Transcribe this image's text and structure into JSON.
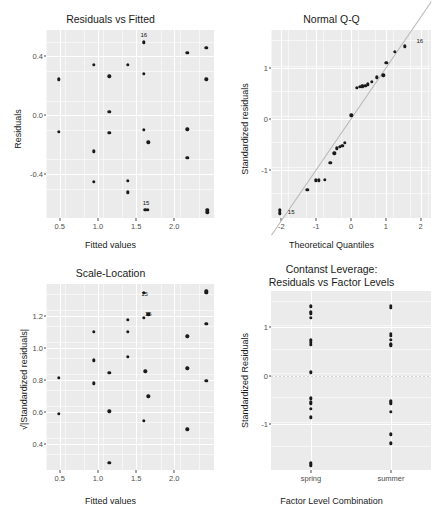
{
  "figure": {
    "kind": "regression-diagnostic-plots",
    "panel_bg": "#ebebeb",
    "grid_color": "#ffffff",
    "point_color": "#1a1a1a",
    "reference_line_color": "#b5b5b5"
  },
  "chart_data": [
    {
      "type": "scatter",
      "title": "Residuals vs Fitted",
      "xlabel": "Fitted values",
      "ylabel": "Residuals",
      "xlim": [
        0.32,
        2.52
      ],
      "ylim": [
        -0.7,
        0.58
      ],
      "xticks": [
        "0.5",
        "1.0",
        "1.5",
        "2.0"
      ],
      "xtickvals": [
        0.5,
        1.0,
        1.5,
        2.0
      ],
      "yticks": [
        "0.4",
        "0.0",
        "-0.4"
      ],
      "ytickvals": [
        0.4,
        0.0,
        -0.4
      ],
      "grid": true,
      "points": [
        {
          "x": 0.49,
          "y": 0.245
        },
        {
          "x": 0.49,
          "y": -0.115
        },
        {
          "x": 0.95,
          "y": 0.345
        },
        {
          "x": 0.95,
          "y": -0.245
        },
        {
          "x": 0.95,
          "y": -0.455
        },
        {
          "x": 1.15,
          "y": 0.265
        },
        {
          "x": 1.15,
          "y": 0.025
        },
        {
          "x": 1.15,
          "y": -0.12
        },
        {
          "x": 1.39,
          "y": 0.345
        },
        {
          "x": 1.39,
          "y": -0.445
        },
        {
          "x": 1.39,
          "y": -0.525
        },
        {
          "x": 1.6,
          "y": 0.495
        },
        {
          "x": 1.6,
          "y": 0.28
        },
        {
          "x": 1.6,
          "y": -0.1
        },
        {
          "x": 1.66,
          "y": -0.185
        },
        {
          "x": 1.62,
          "y": -0.645
        },
        {
          "x": 1.65,
          "y": -0.645
        },
        {
          "x": 2.17,
          "y": 0.425
        },
        {
          "x": 2.17,
          "y": -0.095
        },
        {
          "x": 2.17,
          "y": -0.29
        },
        {
          "x": 2.42,
          "y": 0.46
        },
        {
          "x": 2.42,
          "y": 0.245
        },
        {
          "x": 2.43,
          "y": -0.645
        },
        {
          "x": 2.43,
          "y": -0.66
        }
      ],
      "labels": [
        {
          "x": 1.6,
          "y": 0.545,
          "text": "16"
        },
        {
          "x": 1.63,
          "y": -0.6,
          "text": "15"
        }
      ]
    },
    {
      "type": "scatter",
      "title": "Normal Q-Q",
      "xlabel": "Theoretical Quantiles",
      "ylabel": "Standardized residuals",
      "xlim": [
        -2.3,
        2.3
      ],
      "ylim": [
        -1.95,
        1.75
      ],
      "xticks": [
        "-2",
        "-1",
        "0",
        "1",
        "2"
      ],
      "xtickvals": [
        -2,
        -1,
        0,
        1,
        2
      ],
      "yticks": [
        "1",
        "0",
        "-1"
      ],
      "ytickvals": [
        1,
        0,
        -1
      ],
      "grid": true,
      "reference_line": {
        "slope": 1.0,
        "intercept": 0.02
      },
      "points": [
        {
          "x": -2.05,
          "y": -1.8
        },
        {
          "x": -2.05,
          "y": -1.86
        },
        {
          "x": -1.26,
          "y": -1.4
        },
        {
          "x": -1.02,
          "y": -1.21
        },
        {
          "x": -0.93,
          "y": -1.21
        },
        {
          "x": -0.75,
          "y": -1.2
        },
        {
          "x": -0.6,
          "y": -0.86
        },
        {
          "x": -0.48,
          "y": -0.68
        },
        {
          "x": -0.41,
          "y": -0.58
        },
        {
          "x": -0.33,
          "y": -0.55
        },
        {
          "x": -0.25,
          "y": -0.53
        },
        {
          "x": -0.17,
          "y": -0.47
        },
        {
          "x": 0.01,
          "y": 0.07
        },
        {
          "x": 0.17,
          "y": 0.61
        },
        {
          "x": 0.25,
          "y": 0.63
        },
        {
          "x": 0.33,
          "y": 0.64
        },
        {
          "x": 0.41,
          "y": 0.65
        },
        {
          "x": 0.49,
          "y": 0.68
        },
        {
          "x": 0.6,
          "y": 0.73
        },
        {
          "x": 0.75,
          "y": 0.82
        },
        {
          "x": 0.93,
          "y": 0.86
        },
        {
          "x": 1.02,
          "y": 1.1
        },
        {
          "x": 1.26,
          "y": 1.32
        },
        {
          "x": 1.55,
          "y": 1.43
        }
      ],
      "labels": [
        {
          "x": 1.98,
          "y": 1.53,
          "text": "16"
        },
        {
          "x": -1.72,
          "y": -1.83,
          "text": "15"
        }
      ]
    },
    {
      "type": "scatter",
      "title": "Scale-Location",
      "xlabel": "Fitted values",
      "ylabel": "√|Standardized residuals|",
      "xlim": [
        0.32,
        2.52
      ],
      "ylim": [
        0.24,
        1.4
      ],
      "xticks": [
        "0.5",
        "1.0",
        "1.5",
        "2.0"
      ],
      "xtickvals": [
        0.5,
        1.0,
        1.5,
        2.0
      ],
      "yticks": [
        "1.2",
        "1.0",
        "0.8",
        "0.6",
        "0.4"
      ],
      "ytickvals": [
        1.2,
        1.0,
        0.8,
        0.6,
        0.4
      ],
      "grid": true,
      "points": [
        {
          "x": 0.49,
          "y": 0.815
        },
        {
          "x": 0.49,
          "y": 0.59
        },
        {
          "x": 0.95,
          "y": 1.1
        },
        {
          "x": 0.95,
          "y": 0.925
        },
        {
          "x": 0.95,
          "y": 0.78
        },
        {
          "x": 1.15,
          "y": 0.845
        },
        {
          "x": 1.15,
          "y": 0.605
        },
        {
          "x": 1.15,
          "y": 0.285
        },
        {
          "x": 1.39,
          "y": 1.175
        },
        {
          "x": 1.39,
          "y": 1.1
        },
        {
          "x": 1.39,
          "y": 0.945
        },
        {
          "x": 1.6,
          "y": 1.345
        },
        {
          "x": 1.6,
          "y": 1.19
        },
        {
          "x": 1.66,
          "y": 1.21
        },
        {
          "x": 1.62,
          "y": 0.855
        },
        {
          "x": 1.66,
          "y": 0.7
        },
        {
          "x": 1.6,
          "y": 0.545
        },
        {
          "x": 2.17,
          "y": 1.075
        },
        {
          "x": 2.17,
          "y": 0.875
        },
        {
          "x": 2.17,
          "y": 0.495
        },
        {
          "x": 2.42,
          "y": 1.345
        },
        {
          "x": 2.42,
          "y": 1.15
        },
        {
          "x": 2.42,
          "y": 0.795
        },
        {
          "x": 2.42,
          "y": 1.355
        }
      ],
      "labels": [
        {
          "x": 1.61,
          "y": 1.335,
          "text": "15"
        },
        {
          "x": 1.66,
          "y": 1.215,
          "text": "16"
        }
      ]
    },
    {
      "type": "scatter",
      "title_line1": "Contanst Leverage:",
      "title_line2": "Residuals vs Factor Levels",
      "xlabel": "Factor Level Combination",
      "ylabel": "Standardized Residuals",
      "categories": [
        "spring",
        "summer"
      ],
      "ylim": [
        -1.95,
        1.75
      ],
      "yticks": [
        "1",
        "0",
        "-1"
      ],
      "ytickvals": [
        1,
        0,
        -1
      ],
      "grid": true,
      "zero_line": true,
      "series": [
        {
          "name": "spring",
          "values": [
            1.43,
            1.32,
            1.29,
            1.2,
            0.73,
            0.68,
            0.64,
            0.07,
            -0.47,
            -0.55,
            -0.58,
            -0.68,
            -0.86,
            -1.8,
            -1.86,
            -1.83
          ]
        },
        {
          "name": "summer",
          "values": [
            1.45,
            1.4,
            0.86,
            0.82,
            0.74,
            0.65,
            0.63,
            -0.52,
            -0.55,
            -0.58,
            -0.75,
            -1.21,
            -1.4
          ]
        }
      ]
    }
  ]
}
